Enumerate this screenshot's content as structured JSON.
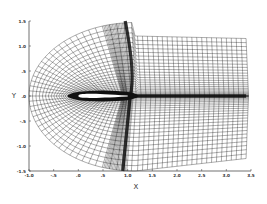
{
  "chart_data": {
    "type": "mesh",
    "title": "",
    "xlabel": "X",
    "ylabel": "Y",
    "xlim": [
      -1.0,
      3.5
    ],
    "ylim": [
      -1.5,
      1.5
    ],
    "x_ticks": [
      "-1.0",
      "-.5",
      ".0",
      ".5",
      "1.0",
      "1.5",
      "2.0",
      "2.5",
      "3.0",
      "3.5"
    ],
    "y_ticks": [
      "1.5",
      "1.0",
      ".5",
      ".0",
      "-.5",
      "-1.0",
      "-1.5"
    ],
    "airfoil": {
      "x_start": 0.0,
      "x_end": 1.0,
      "y": 0.0
    },
    "shock": {
      "x_top": 0.95,
      "x_mid": 1.05,
      "x_bottom": 0.9
    },
    "wake": {
      "y": 0.0,
      "x_start": 1.0,
      "x_end": 3.4
    },
    "grid": {
      "grid": true,
      "background": "#ffffff",
      "line_color": "#111111"
    }
  },
  "axes": {
    "x_title": "X",
    "y_title": "Y"
  }
}
